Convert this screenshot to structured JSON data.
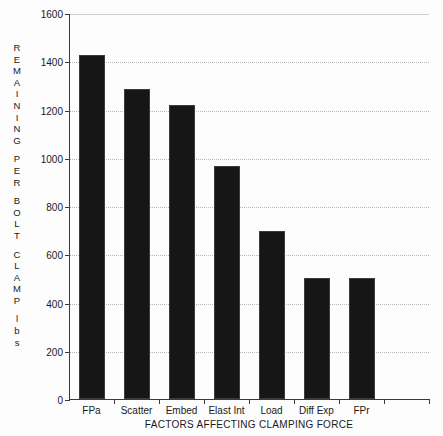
{
  "chart_data": {
    "type": "bar",
    "title": "",
    "xlabel": "FACTORS AFFECTING CLAMPING FORCE",
    "ylabel": "REMAINING PER BOLT CLAMP lbs",
    "ylabel_lines": [
      "REMAINING",
      "PER",
      "BOLT",
      "CLAMP",
      "lbs"
    ],
    "categories": [
      "FPa",
      "Scatter",
      "Embed",
      "Elast Int",
      "Load",
      "Diff Exp",
      "FPr"
    ],
    "values": [
      1425,
      1285,
      1220,
      965,
      695,
      500,
      500
    ],
    "ylim": [
      0,
      1600
    ],
    "yticks": [
      0,
      200,
      400,
      600,
      800,
      1000,
      1200,
      1400,
      1600
    ],
    "ytick_labels": [
      "0",
      "200",
      "400",
      "600",
      "800",
      "1000",
      "1200",
      "1400",
      "1600"
    ],
    "grid": true,
    "legend": "none",
    "bar_color": "#161616",
    "grid_color": "#b9b9b9",
    "axis_color": "#3a3a3a",
    "n_slots": 8
  }
}
